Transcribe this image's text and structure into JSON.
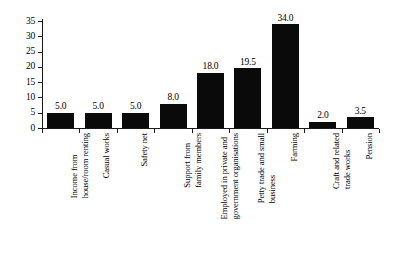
{
  "chart_data": {
    "type": "bar",
    "title": "",
    "subtitle": "",
    "xlabel": "",
    "ylabel": "",
    "ylim": [
      0,
      35
    ],
    "ytick_step": 5,
    "grid": false,
    "legend": null,
    "bar_color": "#0a0a0a",
    "axis_color": "#1a1a1a",
    "background": "#ffffff",
    "value_label_format": "one-decimal",
    "categories": [
      "Income from house/room renting",
      "Casual works",
      "Safety net",
      "Support from family members",
      "Employed in private and government organisations",
      "Petty trade and small business",
      "Farming",
      "Craft and related trade works",
      "Pension"
    ],
    "category_lines": [
      [
        "Income from",
        "house/room renting"
      ],
      [
        "Casual works"
      ],
      [
        "Safety net"
      ],
      [
        "Support from",
        "family members"
      ],
      [
        "Employed in private and",
        "government organisations"
      ],
      [
        "Petty trade and small",
        "business"
      ],
      [
        "Farming"
      ],
      [
        "Craft and related",
        "trade works"
      ],
      [
        "Pension"
      ]
    ],
    "values": [
      5.0,
      5.0,
      5.0,
      8.0,
      18.0,
      19.5,
      34.0,
      2.0,
      3.5
    ],
    "value_labels": [
      "5.0",
      "5.0",
      "5.0",
      "8.0",
      "18.0",
      "19.5",
      "34.0",
      "2.0",
      "3.5"
    ],
    "yticks": [
      0,
      5,
      10,
      15,
      20,
      25,
      30,
      35
    ],
    "ytick_labels": [
      "0",
      "5",
      "10",
      "15",
      "20",
      "25",
      "30",
      "35"
    ]
  }
}
